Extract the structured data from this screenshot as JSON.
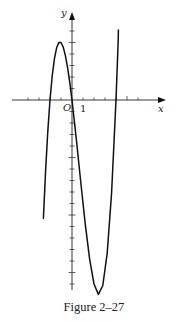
{
  "figure": {
    "caption": "Figure 2–27",
    "x_axis_label": "x",
    "y_axis_label": "y",
    "origin_label": "O",
    "unit_label": "1"
  },
  "chart_data": {
    "type": "line",
    "title": "Figure 2–27",
    "xlabel": "x",
    "ylabel": "y",
    "function_estimate": "y = x^3 - 2x^2 - 8x",
    "roots": [
      -2,
      0,
      4
    ],
    "local_max": {
      "x": -1.1,
      "y": 5
    },
    "local_min": {
      "x": 2.4,
      "y": -17
    },
    "xlim": [
      -6.5,
      8.5
    ],
    "ylim": [
      -17,
      8
    ],
    "x_ticks": [
      -4,
      -3,
      -2,
      -1,
      0,
      1,
      2,
      3,
      4,
      5,
      6
    ],
    "y_ticks_above": [
      1,
      2,
      3,
      4,
      5,
      6
    ],
    "y_ticks_below": [
      -1,
      -2,
      -3,
      -4,
      -5,
      -6,
      -7,
      -8,
      -9,
      -10,
      -11,
      -12,
      -13,
      -14,
      -15,
      -16
    ],
    "tick_labels": [
      "O",
      "1"
    ],
    "grid": false,
    "legend": null,
    "series": [
      {
        "name": "curve",
        "x": [
          -2.6,
          -2.4,
          -2.2,
          -2.0,
          -1.8,
          -1.6,
          -1.4,
          -1.2,
          -1.0,
          -0.8,
          -0.6,
          -0.4,
          -0.2,
          0.0,
          0.4,
          0.8,
          1.2,
          1.6,
          2.0,
          2.4,
          2.8,
          3.2,
          3.6,
          4.0,
          4.2
        ],
        "y": [
          -10.3,
          -6.14,
          -2.73,
          0,
          2.09,
          3.58,
          4.54,
          4.99,
          5.0,
          4.61,
          3.86,
          2.82,
          1.51,
          0,
          -3.46,
          -7.17,
          -10.75,
          -13.82,
          -16.0,
          -16.9,
          -16.13,
          -13.31,
          -8.06,
          0,
          5.21
        ]
      }
    ]
  }
}
